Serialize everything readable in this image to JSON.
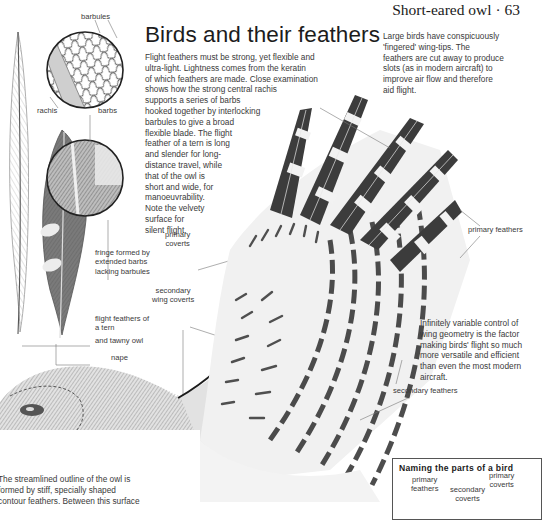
{
  "page": {
    "running_head": "Short-eared owl · 63",
    "title": "Birds and their feathers"
  },
  "intro_text": {
    "lines": [
      "Flight feathers must be strong, yet flexible and",
      "ultra-light. Lightness comes from the keratin",
      "of which feathers are made. Close examination",
      "shows how the strong central rachis",
      "supports a series of barbs",
      "hooked together by interlocking",
      "barbules to give a broad",
      "flexible blade. The flight",
      "feather of a tern is long",
      "and slender for long-",
      "distance travel, while",
      "that of the owl is",
      "short and wide, for",
      "manoeuvrability.",
      "Note the velvety",
      "surface for",
      "silent flight."
    ]
  },
  "wingtip_text": {
    "lines": [
      "Large birds have conspicuously",
      "'fingered' wing-tips. The",
      "feathers are cut away to produce",
      "slots (as in modern aircraft) to",
      "improve air flow and therefore",
      "aid flight."
    ]
  },
  "geometry_text": {
    "lines": [
      "Infinitely variable control of",
      "wing geometry is the factor",
      "making birds' flight so much",
      "more versatile and efficient",
      "than even the most modern",
      "aircraft."
    ]
  },
  "outline_text": {
    "lines": [
      "The streamlined outline of the owl is",
      "formed by stiff, specially shaped",
      "contour feathers. Between this surface"
    ]
  },
  "labels": {
    "barbules": "barbules",
    "rachis": "rachis",
    "barbs": "barbs",
    "fringe": [
      "fringe formed by",
      "extended barbs",
      "lacking barbules"
    ],
    "primary_coverts": [
      "primary",
      "coverts"
    ],
    "secondary_wing_coverts": [
      "secondary",
      "wing coverts"
    ],
    "flight_feathers": [
      "flight feathers of",
      "a tern"
    ],
    "tawny_owl": "and tawny owl",
    "nape": "nape",
    "primary_feathers": "primary feathers",
    "secondary_feathers": "secondary feathers"
  },
  "parts_box": {
    "title": "Naming the parts of a bird",
    "labels": {
      "primary_feathers": [
        "primary",
        "feathers"
      ],
      "secondary_coverts": [
        "secondary",
        "coverts"
      ],
      "primary_coverts": [
        "primary",
        "coverts"
      ]
    }
  }
}
